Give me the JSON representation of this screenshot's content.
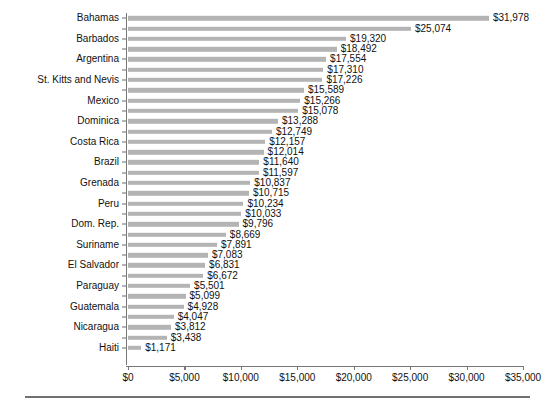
{
  "chart_data": {
    "type": "bar",
    "orientation": "horizontal",
    "title": "",
    "subtitle": "",
    "xlabel": "",
    "ylabel": "",
    "xlim": [
      0,
      35000
    ],
    "xtick_labels": [
      "$0",
      "$5,000",
      "$10,000",
      "$15,000",
      "$20,000",
      "$25,000",
      "$30,000",
      "$35,000"
    ],
    "xtick_values": [
      0,
      5000,
      10000,
      15000,
      20000,
      25000,
      30000,
      35000
    ],
    "grid": false,
    "legend": false,
    "bar_color": "#b4b4b4",
    "axis_color": "#777777",
    "text_color": "#111111",
    "value_prefix": "$",
    "categories": [
      "Bahamas",
      "",
      "Barbados",
      "",
      "Argentina",
      "",
      "St. Kitts and Nevis",
      "",
      "Mexico",
      "",
      "Dominica",
      "",
      "Costa Rica",
      "",
      "Brazil",
      "",
      "Grenada",
      "",
      "Peru",
      "",
      "Dom. Rep.",
      "",
      "Suriname",
      "",
      "El Salvador",
      "",
      "Paraguay",
      "",
      "Guatemala",
      "",
      "Nicaragua",
      "",
      "Haiti"
    ],
    "values": [
      31978,
      25074,
      19320,
      18492,
      17554,
      17310,
      17226,
      15589,
      15266,
      15078,
      13288,
      12749,
      12157,
      12014,
      11640,
      11597,
      10837,
      10715,
      10234,
      10033,
      9796,
      8669,
      7891,
      7083,
      6831,
      6672,
      5501,
      5099,
      4928,
      4047,
      3812,
      3438,
      1171
    ],
    "value_labels": [
      "$31,978",
      "$25,074",
      "$19,320",
      "$18,492",
      "$17,554",
      "$17,310",
      "$17,226",
      "$15,589",
      "$15,266",
      "$15,078",
      "$13,288",
      "$12,749",
      "$12,157",
      "$12,014",
      "$11,640",
      "$11,597",
      "$10,837",
      "$10,715",
      "$10,234",
      "$10,033",
      "$9,796",
      "$8,669",
      "$7,891",
      "$7,083",
      "$6,831",
      "$6,672",
      "$5,501",
      "$5,099",
      "$4,928",
      "$4,047",
      "$3,812",
      "$3,438",
      "$1,171"
    ]
  }
}
